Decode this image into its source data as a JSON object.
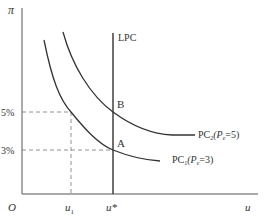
{
  "diagram": {
    "y_axis_label": "π",
    "x_axis_label": "u",
    "origin_label": "O",
    "vertical_line_label": "LPC",
    "point_b": "B",
    "point_a": "A",
    "y_tick_high": "5%",
    "y_tick_low": "3%",
    "x_tick_u1": "u",
    "x_tick_u1_sub": "1",
    "x_tick_ustar": "u*",
    "curve_pc2": {
      "name": "PC",
      "sub": "2",
      "param": "(P",
      "param_sub": "e",
      "param_val": "=5)"
    },
    "curve_pc1": {
      "name": "PC",
      "sub": "1",
      "param": "(P",
      "param_sub": "e",
      "param_val": "=3)"
    },
    "colors": {
      "line": "#333333",
      "dash": "#777777"
    }
  }
}
